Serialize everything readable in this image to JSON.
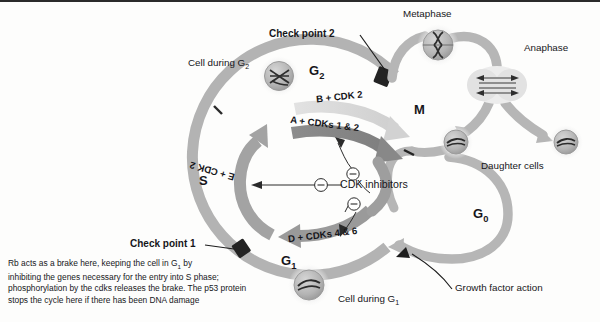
{
  "diagram": {
    "title_semantic": "cell-cycle-diagram",
    "phases": [
      {
        "id": "g2",
        "label": "G2",
        "label_text": "G",
        "sub": "2"
      },
      {
        "id": "m",
        "label": "M",
        "label_text": "M",
        "sub": ""
      },
      {
        "id": "s",
        "label": "S",
        "label_text": "S",
        "sub": ""
      },
      {
        "id": "g1",
        "label": "G1",
        "label_text": "G",
        "sub": "1"
      },
      {
        "id": "g0",
        "label": "G0",
        "label_text": "G",
        "sub": "0"
      }
    ],
    "cyclin_arrows": [
      {
        "id": "cyclin-b",
        "label": "B + CDK 2"
      },
      {
        "id": "cyclin-a",
        "label": "A + CDKs 1 & 2"
      },
      {
        "id": "cyclin-d",
        "label": "D + CDKs 4 & 6"
      },
      {
        "id": "cyclin-e",
        "label": "E + CDK 2"
      }
    ],
    "checkpoints": [
      {
        "id": "check-point-2",
        "label": "Check point 2"
      },
      {
        "id": "check-point-1",
        "label": "Check point 1"
      }
    ],
    "inhibitors": {
      "label": "CDK inhibitors",
      "symbol": "minus-circle-icon",
      "count": 3
    },
    "cells": [
      {
        "id": "cell-g2",
        "label_text": "Cell during G",
        "sub": "2"
      },
      {
        "id": "cell-metaphase",
        "label_text": "Metaphase",
        "sub": ""
      },
      {
        "id": "cell-anaphase",
        "label_text": "Anaphase",
        "sub": ""
      },
      {
        "id": "cell-daughter",
        "label_text": "Daughter cells",
        "sub": ""
      },
      {
        "id": "cell-g1",
        "label_text": "Cell during G",
        "sub": "1"
      }
    ],
    "annotations": [
      {
        "id": "growth-factor-action",
        "label": "Growth factor action"
      }
    ],
    "caption": {
      "line1_a": "Rb acts as a brake here, keeping the cell in G",
      "line1_sub": "1",
      "line1_b": " by",
      "line2": "inhibiting the genes necessary for the entry into S phase;",
      "line3": "phosphorylation by the cdks releases the brake. The p53 protein",
      "line4": "stops the cycle here if there has been DNA damage"
    },
    "colors": {
      "ring_outer": "#b3b3b3",
      "ring_inner_light": "#c9c9c9",
      "arrow_dark": "#8f8f8f",
      "arrow_light": "#d3d3d3",
      "checkpoint_block": "#232323",
      "text": "#16161a",
      "cell_fill": "#b8b8b8",
      "cell_halo": "#e3e3e3",
      "background": "#fdfdfc"
    }
  }
}
